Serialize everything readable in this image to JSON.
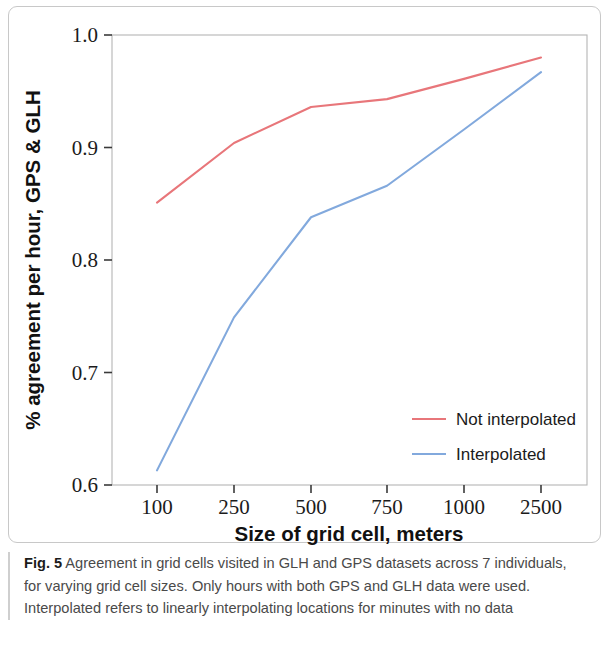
{
  "figure": {
    "label": "Fig. 5",
    "caption": "Agreement in grid cells visited in GLH and GPS datasets across 7 individuals, for varying grid cell sizes. Only hours with both GPS and GLH data were used. Interpolated refers to linearly interpolating locations for minutes with no data"
  },
  "colors": {
    "not_interpolated": "#e8767a",
    "interpolated": "#82a9dd",
    "axis": "#3a3a3a",
    "frame": "#b5b5b5",
    "text": "#1b1b1b",
    "caption_text": "#4a4a4a"
  },
  "chart_data": {
    "type": "line",
    "title": "",
    "xlabel": "Size of grid cell, meters",
    "ylabel": "% agreement per hour, GPS & GLH",
    "categories": [
      "100",
      "250",
      "500",
      "750",
      "1000",
      "2500"
    ],
    "xtick_labels": [
      "100",
      "250",
      "500",
      "750",
      "1000",
      "2500"
    ],
    "ytick_labels": [
      "0.6",
      "0.7",
      "0.8",
      "0.9",
      "1.0"
    ],
    "ylim": [
      0.6,
      1.0
    ],
    "grid": false,
    "legend_position": "bottom-right",
    "series": [
      {
        "name": "Not interpolated",
        "color": "#e8767a",
        "values": [
          0.851,
          0.904,
          0.936,
          0.943,
          0.961,
          0.98
        ]
      },
      {
        "name": "Interpolated",
        "color": "#82a9dd",
        "values": [
          0.613,
          0.749,
          0.838,
          0.866,
          0.916,
          0.967
        ]
      }
    ]
  }
}
